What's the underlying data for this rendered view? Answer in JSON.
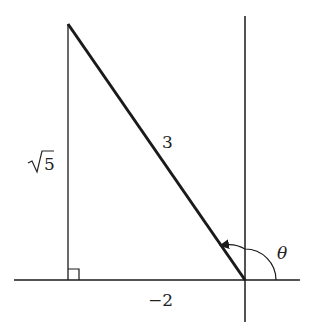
{
  "diagram": {
    "hypotenuse_label": "3",
    "vertical_leg_label_radicand": "5",
    "horizontal_leg_label": "−2",
    "angle_label": "θ",
    "right_angle_marker": true,
    "points": {
      "origin": [
        245,
        280
      ],
      "top_vertex": [
        68,
        24
      ],
      "foot": [
        68,
        280
      ]
    },
    "colors": {
      "stroke": "#1a1a1a",
      "background": "#ffffff"
    }
  }
}
